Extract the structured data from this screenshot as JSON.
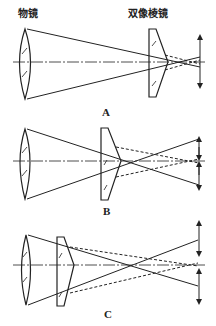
{
  "labels": {
    "objective_lens": "物镜",
    "biprism": "双像棱镜"
  },
  "panels": [
    {
      "caption": "A",
      "description": "Biprism near the image plane; images nearly overlap"
    },
    {
      "caption": "B",
      "description": "Biprism at intermediate distance; images partially separated"
    },
    {
      "caption": "C",
      "description": "Biprism close to objective lens; images widely separated"
    }
  ],
  "colors": {
    "line": "#222222",
    "background": "#ffffff"
  }
}
